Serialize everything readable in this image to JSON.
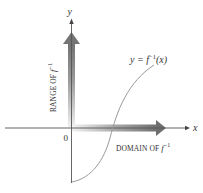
{
  "diagram": {
    "type": "inverse-function-graph",
    "axes": {
      "x_label": "x",
      "y_label": "y",
      "origin_label": "0"
    },
    "curve": {
      "label_lhs": "y = ",
      "label_func": "f",
      "label_sup": "−1",
      "label_arg": "(x)",
      "full_label": "y = f^{-1}(x)"
    },
    "range_arrow": {
      "label_text": "RANGE OF ",
      "label_func": "f",
      "label_sup": "−1",
      "full_label": "RANGE OF f^{-1}"
    },
    "domain_arrow": {
      "label_text": "DOMAIN OF ",
      "label_func": "f",
      "label_sup": "−1",
      "full_label": "DOMAIN OF f^{-1}"
    },
    "colors": {
      "axis": "#555555",
      "curve": "#9a9a9a",
      "arrow_dark": "#777777",
      "arrow_light": "#e6e6e6",
      "text": "#333333"
    }
  }
}
